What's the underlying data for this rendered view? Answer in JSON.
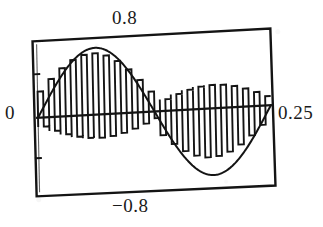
{
  "figure": {
    "kind": "scanned-plot",
    "background_color": "#ffffff",
    "ink_color": "#111111"
  },
  "labels": {
    "top": "0.8",
    "bottom": "−0.8",
    "left": "0",
    "right": "0.25"
  },
  "chart_data": {
    "type": "line",
    "title": "",
    "subtitle": "",
    "xlabel": "",
    "ylabel": "",
    "grid": false,
    "legend": null,
    "legend_position": "none",
    "xlim": [
      0,
      0.25
    ],
    "ylim": [
      -0.8,
      0.8
    ],
    "xtick_labels": [
      "0",
      "0.25"
    ],
    "ytick_labels": [
      "0.8",
      "-0.8"
    ],
    "xtick_values": [
      0,
      0.25
    ],
    "ytick_values": [
      0.8,
      -0.8
    ],
    "axis_zero_line": true,
    "annotations": [],
    "series": [
      {
        "name": "reference-sine",
        "kind": "smooth-sine-envelope",
        "amplitude": 0.8,
        "cycles": 1,
        "phase": 0,
        "samples": 240,
        "description": "one full period of a sine wave of amplitude 0.8 over 0 to 0.25 s"
      },
      {
        "name": "switched-waveform",
        "kind": "pwm-square-modulated",
        "amplitude": 0.8,
        "carrier_pulses": 21,
        "description": "high frequency switched signal whose pulse widths follow the sine envelope, alternating above and below the zero axis"
      }
    ],
    "x": [
      0,
      0.0125,
      0.025,
      0.0375,
      0.05,
      0.0625,
      0.075,
      0.0875,
      0.1,
      0.1125,
      0.125,
      0.1375,
      0.15,
      0.1625,
      0.175,
      0.1875,
      0.2,
      0.2125,
      0.225,
      0.2375,
      0.25
    ],
    "values": [
      0,
      0.247,
      0.47,
      0.647,
      0.762,
      0.8,
      0.762,
      0.647,
      0.47,
      0.247,
      0,
      -0.247,
      -0.47,
      -0.647,
      -0.762,
      -0.8,
      -0.762,
      -0.647,
      -0.47,
      -0.247,
      0
    ]
  }
}
